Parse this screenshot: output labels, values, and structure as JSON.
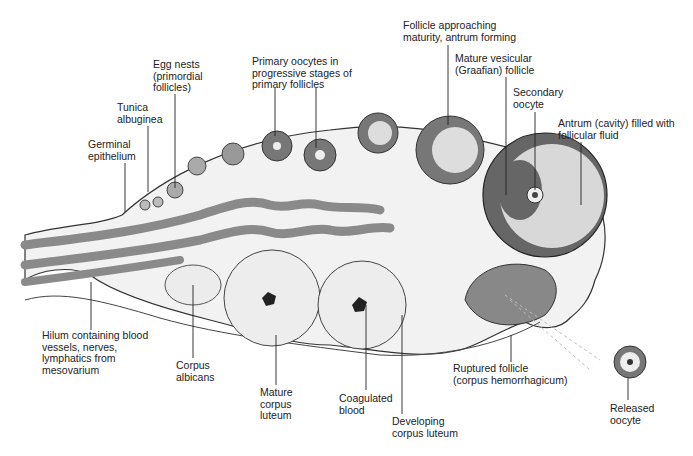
{
  "diagram": {
    "colors": {
      "background": "#ffffff",
      "tissue": "#efefef",
      "stroma": "#f6f6f6",
      "vessel": "#8a8a8a",
      "follicle_wall": "#555555",
      "antrum": "#d8d8d8",
      "ink": "#222222"
    },
    "labels": [
      {
        "id": "germinal-epithelium",
        "text": "Germinal\nepithelium",
        "x": 88,
        "y": 139
      },
      {
        "id": "tunica-albuginea",
        "text": "Tunica\nalbuginea",
        "x": 117,
        "y": 102
      },
      {
        "id": "egg-nests",
        "text": "Egg nests\n(primordial\nfollicles)",
        "x": 153,
        "y": 59
      },
      {
        "id": "primary-oocytes",
        "text": "Primary oocytes in\nprogressive stages of\nprimary follicles",
        "x": 252,
        "y": 56
      },
      {
        "id": "follicle-approaching-maturity",
        "text": "Follicle approaching\nmaturity, antrum forming",
        "x": 403,
        "y": 20
      },
      {
        "id": "mature-vesicular-follicle",
        "text": "Mature vesicular\n(Graafian) follicle",
        "x": 455,
        "y": 53
      },
      {
        "id": "secondary-oocyte",
        "text": "Secondary\noocyte",
        "x": 513,
        "y": 87
      },
      {
        "id": "antrum",
        "text": "Antrum (cavity) filled with\nfollicular fluid",
        "x": 558,
        "y": 118
      },
      {
        "id": "hilum",
        "text": "Hilum containing blood\nvessels, nerves,\nlymphatics from\nmesovarium",
        "x": 42,
        "y": 330
      },
      {
        "id": "corpus-albicans",
        "text": "Corpus\nalbicans",
        "x": 176,
        "y": 360
      },
      {
        "id": "mature-corpus-luteum",
        "text": "Mature\ncorpus\nluteum",
        "x": 260,
        "y": 387
      },
      {
        "id": "coagulated-blood",
        "text": "Coagulated\nblood",
        "x": 339,
        "y": 393
      },
      {
        "id": "developing-corpus-luteum",
        "text": "Developing\ncorpus luteum",
        "x": 392,
        "y": 416
      },
      {
        "id": "ruptured-follicle",
        "text": "Ruptured follicle\n(corpus hemorrhagicum)",
        "x": 453,
        "y": 363
      },
      {
        "id": "released-oocyte",
        "text": "Released\noocyte",
        "x": 610,
        "y": 403
      }
    ]
  }
}
